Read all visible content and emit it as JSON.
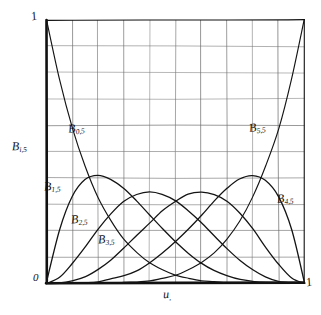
{
  "figure": {
    "kind": "hand-drawn-plot",
    "paper_color": "#ffffff",
    "ink_color": "#1a1a1a",
    "grid_color": "#6b6b6b",
    "axis_color": "#111111"
  },
  "axes": {
    "y_top_label": "1",
    "origin_label": "0",
    "x_right_label": "1",
    "y_title_base": "B",
    "y_title_sub": "i,5",
    "x_title_base": "u",
    "x_title_sub": ","
  },
  "curve_labels": [
    {
      "id": "b0",
      "base": "B",
      "sub": "0,5"
    },
    {
      "id": "b1",
      "base": "B",
      "sub": "1,5"
    },
    {
      "id": "b2",
      "base": "B",
      "sub": "2,5"
    },
    {
      "id": "b3",
      "base": "B",
      "sub": "3,5"
    },
    {
      "id": "b4",
      "base": "B",
      "sub": "4,5"
    },
    {
      "id": "b5",
      "base": "B",
      "sub": "5,5"
    }
  ],
  "chart_data": {
    "type": "line",
    "title": "",
    "xlabel": "u",
    "ylabel": "B i,5",
    "xlim": [
      0,
      1
    ],
    "ylim": [
      0,
      1
    ],
    "grid": true,
    "grid_divisions_x": 10,
    "grid_divisions_y": 10,
    "xticks": [
      0,
      0.1,
      0.2,
      0.3,
      0.4,
      0.5,
      0.6,
      0.7,
      0.8,
      0.9,
      1.0
    ],
    "yticks": [
      0,
      0.1,
      0.2,
      0.3,
      0.4,
      0.5,
      0.6,
      0.7,
      0.8,
      0.9,
      1.0
    ],
    "xtick_labels": [
      "0",
      "",
      "",
      "",
      "",
      "",
      "",
      "",
      "",
      "",
      "1"
    ],
    "ytick_labels": [
      "0",
      "",
      "",
      "",
      "",
      "",
      "",
      "",
      "",
      "",
      "1"
    ],
    "legend": "inline-annotations",
    "x": [
      0,
      0.05,
      0.1,
      0.15,
      0.2,
      0.25,
      0.3,
      0.35,
      0.4,
      0.45,
      0.5,
      0.55,
      0.6,
      0.65,
      0.7,
      0.75,
      0.8,
      0.85,
      0.9,
      0.95,
      1
    ],
    "series": [
      {
        "name": "B 0,5",
        "peak_x": 0.0,
        "peak_y": 1.0,
        "values": [
          1.0,
          0.774,
          0.59,
          0.444,
          0.328,
          0.237,
          0.168,
          0.116,
          0.078,
          0.05,
          0.031,
          0.018,
          0.01,
          0.005,
          0.002,
          0.001,
          0.0003,
          0.0001,
          1e-05,
          0.0,
          0.0
        ]
      },
      {
        "name": "B 1,5",
        "peak_x": 0.2,
        "peak_y": 0.41,
        "values": [
          0.0,
          0.204,
          0.328,
          0.392,
          0.41,
          0.396,
          0.36,
          0.312,
          0.259,
          0.206,
          0.156,
          0.113,
          0.077,
          0.048,
          0.028,
          0.015,
          0.006,
          0.002,
          0.0005,
          5e-05,
          0.0
        ]
      },
      {
        "name": "B 2,5",
        "peak_x": 0.4,
        "peak_y": 0.346,
        "values": [
          0.0,
          0.021,
          0.073,
          0.138,
          0.205,
          0.264,
          0.309,
          0.336,
          0.346,
          0.337,
          0.312,
          0.276,
          0.23,
          0.181,
          0.132,
          0.088,
          0.051,
          0.024,
          0.008,
          0.001,
          0.0
        ]
      },
      {
        "name": "B 3,5",
        "peak_x": 0.6,
        "peak_y": 0.346,
        "values": [
          0.0,
          0.001,
          0.008,
          0.024,
          0.051,
          0.088,
          0.132,
          0.181,
          0.23,
          0.276,
          0.312,
          0.337,
          0.346,
          0.336,
          0.309,
          0.264,
          0.205,
          0.138,
          0.073,
          0.021,
          0.0
        ]
      },
      {
        "name": "B 4,5",
        "peak_x": 0.8,
        "peak_y": 0.41,
        "values": [
          0.0,
          5e-05,
          0.0005,
          0.002,
          0.006,
          0.015,
          0.028,
          0.048,
          0.077,
          0.113,
          0.156,
          0.206,
          0.259,
          0.312,
          0.36,
          0.396,
          0.41,
          0.392,
          0.328,
          0.204,
          0.0
        ]
      },
      {
        "name": "B 5,5",
        "peak_x": 1.0,
        "peak_y": 1.0,
        "values": [
          0.0,
          0.0,
          1e-05,
          0.0001,
          0.0003,
          0.001,
          0.002,
          0.005,
          0.01,
          0.018,
          0.031,
          0.05,
          0.078,
          0.116,
          0.168,
          0.237,
          0.328,
          0.444,
          0.59,
          0.774,
          1.0
        ]
      }
    ]
  }
}
